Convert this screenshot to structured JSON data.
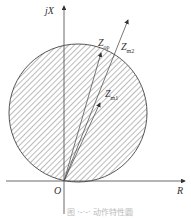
{
  "diagram": {
    "axes": {
      "y_label": "jX",
      "x_label": "R",
      "origin_label": "O"
    },
    "vectors": [
      {
        "label": "Z",
        "sub": "op"
      },
      {
        "label": "Z",
        "sub": "m2"
      },
      {
        "label": "Z",
        "sub": "m1"
      }
    ],
    "region": "hatched circle through origin (operating characteristic)",
    "caption": "图 ·-·-·  动作特性圆"
  }
}
